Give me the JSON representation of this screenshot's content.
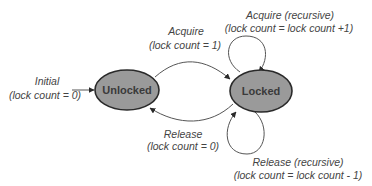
{
  "diagram": {
    "type": "state-machine",
    "colors": {
      "node_fill": "#9a9a9a",
      "node_stroke": "#2a2a2a",
      "edge": "#555555",
      "text": "#444444"
    },
    "nodes": [
      {
        "id": "unlocked",
        "label": "Unlocked"
      },
      {
        "id": "locked",
        "label": "Locked"
      }
    ],
    "initial": {
      "line1": "Initial",
      "line2": "(lock count = 0)"
    },
    "edges": {
      "acquire": {
        "from": "unlocked",
        "to": "locked",
        "line1": "Acquire",
        "line2": "(lock count = 1)"
      },
      "release": {
        "from": "locked",
        "to": "unlocked",
        "line1": "Release",
        "line2": "(lock count = 0)"
      },
      "acquire_recursive": {
        "from": "locked",
        "to": "locked",
        "line1": "Acquire (recursive)",
        "line2": "(lock count = lock count +1)"
      },
      "release_recursive": {
        "from": "locked",
        "to": "locked",
        "line1": "Release (recursive)",
        "line2": "(lock count = lock count - 1)"
      }
    }
  }
}
